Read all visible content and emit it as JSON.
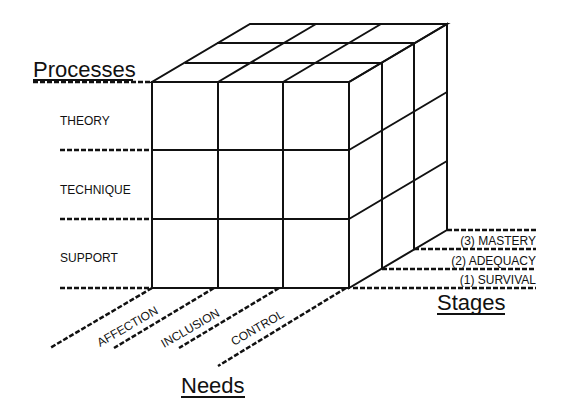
{
  "diagram": {
    "type": "3d-cube-model",
    "axes": {
      "processes": {
        "title": "Processes",
        "items": [
          "THEORY",
          "TECHNIQUE",
          "SUPPORT"
        ]
      },
      "needs": {
        "title": "Needs",
        "items": [
          "AFFECTION",
          "INCLUSION",
          "CONTROL"
        ]
      },
      "stages": {
        "title": "Stages",
        "items": [
          "(3) MASTERY",
          "(2) ADEQUACY",
          "(1) SURVIVAL"
        ]
      }
    },
    "colors": {
      "line": "#111111",
      "background": "#ffffff"
    }
  }
}
